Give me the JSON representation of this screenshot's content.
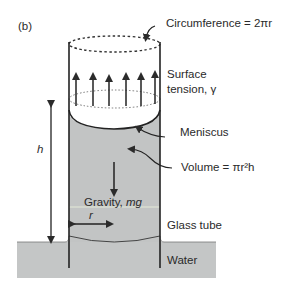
{
  "figure": {
    "panel_label": "(b)",
    "labels": {
      "circumference": "Circumference = 2πr",
      "surface_tension_line1": "Surface",
      "surface_tension_line2": "tension, γ",
      "meniscus": "Meniscus",
      "volume": "Volume = πr²h",
      "gravity_prefix": "Gravity, ",
      "gravity_symbol": "mg",
      "radius": "r",
      "height": "h",
      "glass_tube": "Glass tube",
      "water": "Water"
    },
    "colors": {
      "water_fill": "#c4c6c6",
      "column_fill": "#c2c4c4",
      "line": "#2b2b2b",
      "background": "#ffffff"
    }
  }
}
